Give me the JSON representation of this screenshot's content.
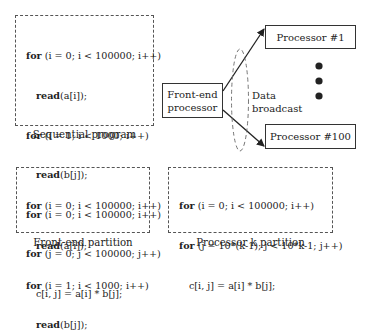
{
  "sequential": {
    "caption": "Sequential program",
    "lines": [
      {
        "kw": "for",
        "rest": " (i = 0; i < 100000; i++)",
        "indent": 0
      },
      {
        "kw": "read",
        "rest": "(a[i]);",
        "indent": 1
      },
      {
        "kw": "for",
        "rest": " (i = 1; i < 1000; i++)",
        "indent": 0
      },
      {
        "kw": "read",
        "rest": "(b[j]);",
        "indent": 1
      },
      {
        "kw": "for",
        "rest": " (i = 0; i < 100000; i++)",
        "indent": 0
      },
      {
        "kw": "for",
        "rest": " (j = 0; j < 100000; j++)",
        "indent": 0
      },
      {
        "kw": "",
        "rest": "c[i, j] = a[i] * b[j];",
        "indent": 1
      }
    ]
  },
  "front_end_partition": {
    "caption": "Front-end partition",
    "lines": [
      {
        "kw": "for",
        "rest": " (i = 0; i < 100000; i++)",
        "indent": 0
      },
      {
        "kw": "read",
        "rest": "(a[i]);",
        "indent": 1
      },
      {
        "kw": "for",
        "rest": " (i = 1; i < 1000; i++)",
        "indent": 0
      },
      {
        "kw": "read",
        "rest": "(b[j]);",
        "indent": 1
      }
    ]
  },
  "processor_k_partition": {
    "caption": "Processor k partition",
    "lines": [
      {
        "kw": "for",
        "rest": " (i = 0; i < 100000; i++)",
        "indent": 0
      },
      {
        "kw": "for",
        "rest": " (j = 10*(k-1); j < 10*k-1; j++)",
        "indent": 0
      },
      {
        "kw": "",
        "rest": "c[i, j] = a[i] * b[j];",
        "indent": 1
      }
    ]
  },
  "front_end_processor": {
    "line1": "Front-end",
    "line2": "processor"
  },
  "processors": {
    "first": "Processor #1",
    "last": "Processor #100"
  },
  "broadcast": {
    "line1": "Data",
    "line2": "broadcast"
  }
}
